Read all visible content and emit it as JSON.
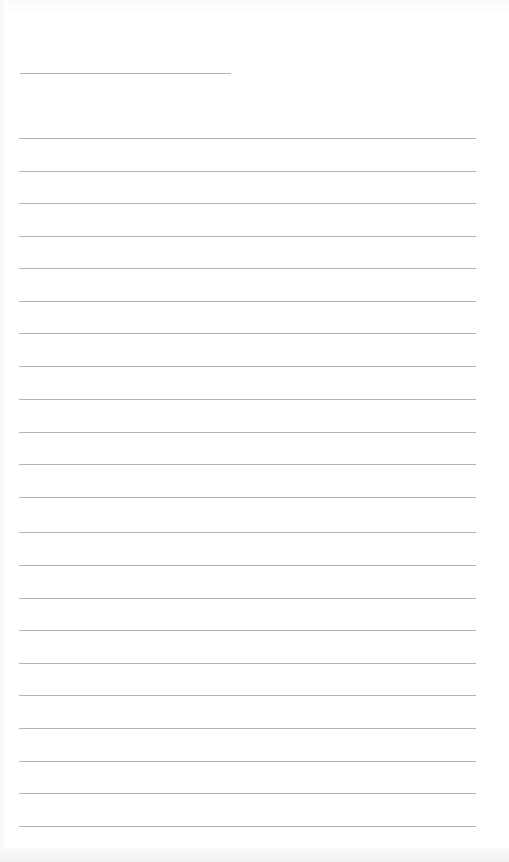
{
  "page": {
    "type": "blank lined sheet",
    "background_color": "#ffffff",
    "line_color": "#b3b3b3",
    "title_line": {
      "y": 73,
      "x_start": 20,
      "x_end": 231
    },
    "ruled_lines": {
      "count": 22,
      "x_start": 19,
      "x_end": 476,
      "y_positions": [
        138,
        171,
        203,
        236,
        268,
        301,
        333,
        366,
        399,
        432,
        464,
        497,
        532,
        565,
        598,
        630,
        663,
        695,
        728,
        761,
        793,
        826
      ]
    },
    "text_content": []
  }
}
